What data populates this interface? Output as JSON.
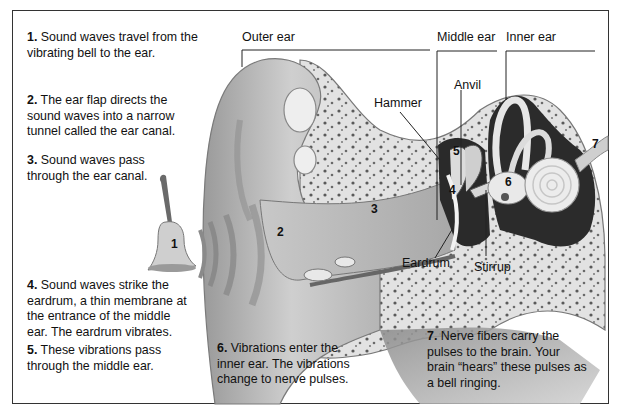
{
  "steps": [
    {
      "num": "1.",
      "text": "Sound waves travel from the vibrating bell to the ear."
    },
    {
      "num": "2.",
      "text": "The ear flap directs the sound waves into a narrow tunnel called the ear canal."
    },
    {
      "num": "3.",
      "text": "Sound waves pass through the ear canal."
    },
    {
      "num": "4.",
      "text": "Sound waves strike the eardrum, a thin membrane at the entrance of the middle ear. The eardrum vibrates."
    },
    {
      "num": "5.",
      "text": "These vibrations pass through the middle ear."
    },
    {
      "num": "6.",
      "text": "Vibrations enter the inner ear. The vibrations change to nerve pulses."
    },
    {
      "num": "7.",
      "text": "Nerve fibers carry the pulses to the brain. Your brain “hears” these pulses as a bell ringing."
    }
  ],
  "section_labels": {
    "outer_ear": "Outer ear",
    "middle_ear": "Middle ear",
    "inner_ear": "Inner ear"
  },
  "part_labels": {
    "hammer": "Hammer",
    "anvil": "Anvil",
    "eardrum": "Eardrum",
    "stirrup": "Stirrup"
  },
  "diagram_numbers": [
    "1",
    "2",
    "3",
    "4",
    "5",
    "6",
    "7"
  ]
}
